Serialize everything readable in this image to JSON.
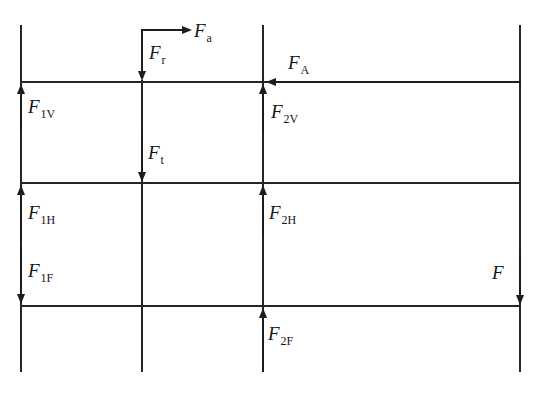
{
  "diagram": {
    "colors": {
      "background": "#ffffff",
      "line": "#262626",
      "arrow": "#1d1d1d",
      "text": "#141414"
    },
    "forces": {
      "fa": {
        "main": "F",
        "sub": "a",
        "direction": "right"
      },
      "fr": {
        "main": "F",
        "sub": "r",
        "direction": "down"
      },
      "fA": {
        "main": "F",
        "sub": "A",
        "direction": "left"
      },
      "f1v": {
        "main": "F",
        "sub": "1V",
        "direction": "up"
      },
      "f2v": {
        "main": "F",
        "sub": "2V",
        "direction": "up"
      },
      "ft": {
        "main": "F",
        "sub": "t",
        "direction": "down"
      },
      "f1h": {
        "main": "F",
        "sub": "1H",
        "direction": "up"
      },
      "f2h": {
        "main": "F",
        "sub": "2H",
        "direction": "up"
      },
      "f1f": {
        "main": "F",
        "sub": "1F",
        "direction": "down"
      },
      "f2f": {
        "main": "F",
        "sub": "2F",
        "direction": "up"
      },
      "f": {
        "main": "F",
        "sub": "",
        "direction": "down"
      }
    }
  }
}
